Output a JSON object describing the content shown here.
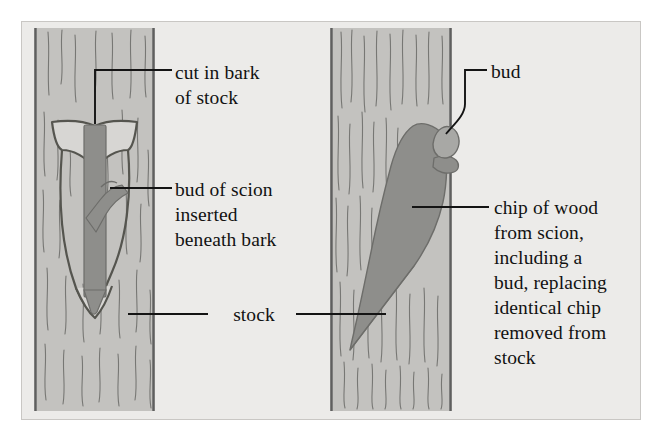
{
  "figure": {
    "domain": "botanical-diagram",
    "background_color": "#ffffff",
    "panel_color": "#ecebe9",
    "panel_border_color": "#c9c7c4",
    "stock_fill_color": "#c3c2bf",
    "stock_edge_color": "#6b6b6b",
    "graft_fill_color": "#8e8e8b",
    "bud_fill_color": "#a8a8a5",
    "grain_line_color": "#6f6f6f",
    "leader_line_color": "#141414",
    "text_color": "#121212"
  },
  "labels": {
    "cut_in_bark": "cut in bark\nof stock",
    "bud_of_scion": "bud of scion\ninserted\nbeneath bark",
    "stock": "stock",
    "bud": "bud",
    "chip_of_wood": "chip of wood\nfrom scion,\nincluding a\nbud, replacing\nidentical chip\nremoved from\nstock"
  },
  "panels": [
    {
      "id": "left-panel",
      "name": "t-budding-panel",
      "stock_column": {
        "x": 34,
        "y": 28,
        "width": 121,
        "height": 383
      },
      "parts": [
        {
          "name": "t-cut-bark-flap",
          "label_ref": "cut_in_bark"
        },
        {
          "name": "scion-strip-inserted",
          "label_ref": "bud_of_scion"
        },
        {
          "name": "scion-bud-protrusion",
          "label_ref": "bud_of_scion"
        },
        {
          "name": "stock-trunk",
          "label_ref": "stock"
        }
      ]
    },
    {
      "id": "right-panel",
      "name": "chip-budding-panel",
      "stock_column": {
        "x": 330,
        "y": 28,
        "width": 122,
        "height": 383
      },
      "parts": [
        {
          "name": "wood-chip-from-scion",
          "label_ref": "chip_of_wood"
        },
        {
          "name": "bud-on-chip",
          "label_ref": "bud"
        },
        {
          "name": "stock-trunk",
          "label_ref": "stock"
        }
      ]
    }
  ]
}
